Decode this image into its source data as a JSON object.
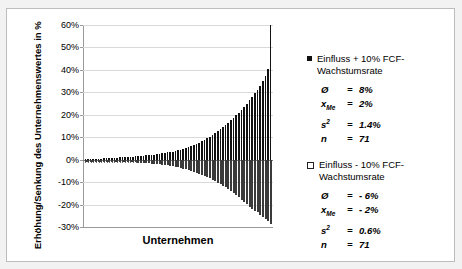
{
  "chart_data": {
    "type": "bar",
    "title": "",
    "xlabel": "Unternehmen",
    "ylabel": "Erhöhung/Senkung des Unternehmenswertes in %",
    "ylim": [
      -30,
      60
    ],
    "ytick_labels": [
      "60%",
      "50%",
      "40%",
      "30%",
      "20%",
      "10%",
      "0%",
      "-10%",
      "-20%",
      "-30%"
    ],
    "ytick_values": [
      60,
      50,
      40,
      30,
      20,
      10,
      0,
      -10,
      -20,
      -30
    ],
    "grid": true,
    "legend_position": "right",
    "categories": [
      "1",
      "2",
      "3",
      "4",
      "5",
      "6",
      "7",
      "8",
      "9",
      "10",
      "11",
      "12",
      "13",
      "14",
      "15",
      "16",
      "17",
      "18",
      "19",
      "20",
      "21",
      "22",
      "23",
      "24",
      "25",
      "26",
      "27",
      "28",
      "29",
      "30",
      "31",
      "32",
      "33",
      "34",
      "35",
      "36",
      "37",
      "38",
      "39",
      "40",
      "41",
      "42",
      "43",
      "44",
      "45",
      "46",
      "47",
      "48",
      "49",
      "50",
      "51",
      "52",
      "53",
      "54",
      "55",
      "56",
      "57",
      "58",
      "59",
      "60",
      "61",
      "62",
      "63",
      "64",
      "65",
      "66",
      "67",
      "68",
      "69",
      "70",
      "71"
    ],
    "series": [
      {
        "name": "Einfluss + 10% FCF-Wachstumsrate",
        "style": "filled",
        "color": "#111111",
        "values": [
          0.2,
          0.3,
          0.3,
          0.4,
          0.4,
          0.5,
          0.5,
          0.6,
          0.6,
          0.7,
          0.8,
          0.8,
          0.9,
          1.0,
          1.0,
          1.1,
          1.2,
          1.3,
          1.4,
          1.5,
          1.6,
          1.7,
          1.8,
          1.9,
          2.0,
          2.1,
          2.2,
          2.4,
          2.6,
          2.8,
          3.0,
          3.2,
          3.4,
          3.6,
          3.9,
          4.2,
          4.5,
          4.8,
          5.2,
          5.6,
          6.0,
          6.5,
          7.0,
          7.6,
          8.2,
          8.8,
          9.5,
          10.2,
          11.0,
          11.8,
          12.6,
          13.5,
          14.4,
          15.4,
          16.4,
          17.5,
          18.6,
          19.8,
          21.0,
          22.3,
          23.6,
          25.0,
          26.5,
          28.0,
          29.6,
          31.2,
          33.0,
          35.0,
          37.5,
          40.5,
          60.0
        ]
      },
      {
        "name": "Einfluss - 10% FCF-Wachstumsrate",
        "style": "hollow",
        "color": "#ffffff",
        "values": [
          -0.2,
          -0.2,
          -0.3,
          -0.3,
          -0.3,
          -0.4,
          -0.4,
          -0.5,
          -0.5,
          -0.6,
          -0.6,
          -0.7,
          -0.7,
          -0.8,
          -0.8,
          -0.9,
          -1.0,
          -1.0,
          -1.1,
          -1.2,
          -1.3,
          -1.4,
          -1.5,
          -1.6,
          -1.7,
          -1.8,
          -1.9,
          -2.0,
          -2.1,
          -2.3,
          -2.4,
          -2.6,
          -2.8,
          -3.0,
          -3.2,
          -3.4,
          -3.7,
          -4.0,
          -4.3,
          -4.6,
          -5.0,
          -5.4,
          -5.8,
          -6.2,
          -6.7,
          -7.2,
          -7.7,
          -8.3,
          -8.9,
          -9.5,
          -10.2,
          -10.9,
          -11.6,
          -12.4,
          -13.2,
          -14.0,
          -14.9,
          -15.8,
          -16.8,
          -17.8,
          -18.8,
          -19.9,
          -21.0,
          -22.2,
          -23.0,
          -23.5,
          -24.5,
          -25.5,
          -26.5,
          -27.5,
          -28.5
        ]
      }
    ]
  },
  "axis": {
    "y_title": "Erhöhung/Senkung des Unternehmenswertes in %",
    "x_title": "Unternehmen"
  },
  "legend": {
    "top": {
      "label": "Einfluss + 10% FCF-Wachstumsrate",
      "marker": "filled-square-icon",
      "stats": [
        {
          "symbol": "Ø",
          "sub": "",
          "eq": "=",
          "value": "8%"
        },
        {
          "symbol": "x",
          "sub": "Me",
          "eq": "=",
          "value": "2%"
        },
        {
          "symbol": "s",
          "sup": "2",
          "eq": "=",
          "value": "1.4%"
        },
        {
          "symbol": "n",
          "sub": "",
          "eq": "=",
          "value": "71"
        }
      ]
    },
    "bottom": {
      "label": "Einfluss - 10% FCF-Wachstumsrate",
      "marker": "hollow-square-icon",
      "stats": [
        {
          "symbol": "Ø",
          "sub": "",
          "eq": "=",
          "value": "- 6%"
        },
        {
          "symbol": "x",
          "sub": "Me",
          "eq": "=",
          "value": "- 2%"
        },
        {
          "symbol": "s",
          "sup": "2",
          "eq": "=",
          "value": "0.6%"
        },
        {
          "symbol": "n",
          "sub": "",
          "eq": "=",
          "value": "71"
        }
      ]
    }
  }
}
